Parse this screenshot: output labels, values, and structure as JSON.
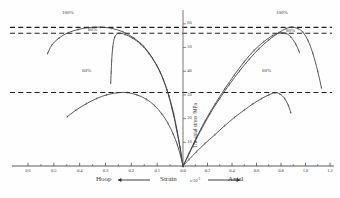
{
  "chart_data": {
    "type": "line",
    "title": "",
    "xlabel": "Strain",
    "xlabel_symbol": "ε/10",
    "xlabel_exponent": "-3",
    "ylabel": "The axial stress /MPa",
    "left_axis_caption": "Hoop",
    "right_axis_caption": "Axial",
    "x_ticks_left": [
      "0.6",
      "0.5",
      "0.4",
      "0.3",
      "0.2",
      "0.1",
      "0.0"
    ],
    "x_ticks_right": [
      "0.0",
      "0.2",
      "0.4",
      "0.6",
      "0.8",
      "1.0",
      "1.2"
    ],
    "y_ticks": [
      "60",
      "50",
      "40",
      "30",
      "20",
      "10"
    ],
    "xlim_left": [
      0.6,
      0.0
    ],
    "xlim_right": [
      0.0,
      1.2
    ],
    "ylim": [
      0,
      65
    ],
    "grid": false,
    "legend_position": "inline-annotations",
    "annotations": [
      {
        "text": "100%",
        "side": "hoop"
      },
      {
        "text": "80%",
        "side": "hoop"
      },
      {
        "text": "60%",
        "side": "hoop"
      },
      {
        "text": "100%",
        "side": "axial"
      },
      {
        "text": "80%",
        "side": "axial"
      },
      {
        "text": "60%",
        "side": "axial"
      }
    ],
    "peak_dashed_lines": [
      58.5,
      56.0,
      31.0
    ],
    "series": [
      {
        "name": "100% hoop",
        "branch": "hoop",
        "peak_stress": 58.5,
        "points": [
          [
            0.0,
            0.0
          ],
          [
            0.012,
            8.0
          ],
          [
            0.026,
            16.0
          ],
          [
            0.042,
            24.0
          ],
          [
            0.062,
            32.0
          ],
          [
            0.088,
            39.5
          ],
          [
            0.118,
            45.5
          ],
          [
            0.152,
            50.5
          ],
          [
            0.19,
            54.0
          ],
          [
            0.232,
            56.6
          ],
          [
            0.276,
            58.1
          ],
          [
            0.32,
            58.6
          ],
          [
            0.366,
            58.4
          ],
          [
            0.406,
            57.6
          ],
          [
            0.446,
            56.2
          ],
          [
            0.48,
            54.0
          ],
          [
            0.508,
            51.0
          ],
          [
            0.524,
            47.5
          ]
        ]
      },
      {
        "name": "80% hoop",
        "branch": "hoop",
        "peak_stress": 56.0,
        "points": [
          [
            0.0,
            0.0
          ],
          [
            0.01,
            7.0
          ],
          [
            0.022,
            14.5
          ],
          [
            0.036,
            22.0
          ],
          [
            0.054,
            29.5
          ],
          [
            0.076,
            36.5
          ],
          [
            0.102,
            42.5
          ],
          [
            0.132,
            47.5
          ],
          [
            0.164,
            51.4
          ],
          [
            0.196,
            54.0
          ],
          [
            0.224,
            55.5
          ],
          [
            0.248,
            56.0
          ],
          [
            0.264,
            54.5
          ],
          [
            0.272,
            50.0
          ],
          [
            0.276,
            44.5
          ],
          [
            0.278,
            39.5
          ],
          [
            0.28,
            35.0
          ]
        ]
      },
      {
        "name": "60% hoop",
        "branch": "hoop",
        "peak_stress": 31.0,
        "points": [
          [
            0.0,
            0.0
          ],
          [
            0.01,
            4.5
          ],
          [
            0.022,
            9.0
          ],
          [
            0.038,
            13.5
          ],
          [
            0.058,
            18.0
          ],
          [
            0.082,
            22.0
          ],
          [
            0.11,
            25.5
          ],
          [
            0.142,
            28.2
          ],
          [
            0.178,
            30.0
          ],
          [
            0.216,
            31.0
          ],
          [
            0.256,
            30.9
          ],
          [
            0.296,
            30.0
          ],
          [
            0.334,
            28.5
          ],
          [
            0.374,
            26.3
          ],
          [
            0.414,
            23.6
          ],
          [
            0.448,
            20.8
          ]
        ]
      },
      {
        "name": "100% axial",
        "branch": "axial",
        "peak_stress": 58.5,
        "points": [
          [
            0.0,
            0.0
          ],
          [
            0.04,
            4.0
          ],
          [
            0.09,
            9.5
          ],
          [
            0.15,
            15.5
          ],
          [
            0.22,
            22.0
          ],
          [
            0.3,
            28.5
          ],
          [
            0.38,
            34.5
          ],
          [
            0.46,
            40.0
          ],
          [
            0.54,
            45.0
          ],
          [
            0.62,
            49.5
          ],
          [
            0.7,
            53.2
          ],
          [
            0.78,
            56.2
          ],
          [
            0.84,
            58.0
          ],
          [
            0.89,
            58.6
          ],
          [
            0.94,
            58.0
          ],
          [
            0.98,
            56.4
          ],
          [
            1.02,
            53.0
          ],
          [
            1.06,
            47.5
          ],
          [
            1.1,
            40.0
          ],
          [
            1.13,
            33.0
          ]
        ]
      },
      {
        "name": "80% axial",
        "branch": "axial",
        "peak_stress": 56.0,
        "points": [
          [
            0.0,
            0.0
          ],
          [
            0.05,
            5.5
          ],
          [
            0.11,
            12.0
          ],
          [
            0.18,
            19.0
          ],
          [
            0.26,
            26.0
          ],
          [
            0.34,
            32.5
          ],
          [
            0.42,
            38.5
          ],
          [
            0.5,
            44.0
          ],
          [
            0.58,
            48.8
          ],
          [
            0.66,
            52.5
          ],
          [
            0.73,
            55.0
          ],
          [
            0.79,
            56.2
          ],
          [
            0.84,
            56.0
          ],
          [
            0.88,
            54.5
          ],
          [
            0.92,
            51.5
          ],
          [
            0.95,
            48.0
          ]
        ]
      },
      {
        "name": "60% axial",
        "branch": "axial",
        "peak_stress": 31.0,
        "points": [
          [
            0.0,
            0.0
          ],
          [
            0.05,
            2.8
          ],
          [
            0.11,
            6.0
          ],
          [
            0.18,
            9.5
          ],
          [
            0.26,
            13.2
          ],
          [
            0.34,
            17.0
          ],
          [
            0.42,
            20.5
          ],
          [
            0.5,
            23.6
          ],
          [
            0.57,
            26.2
          ],
          [
            0.64,
            28.4
          ],
          [
            0.7,
            30.0
          ],
          [
            0.75,
            30.9
          ],
          [
            0.79,
            30.4
          ],
          [
            0.83,
            28.5
          ],
          [
            0.86,
            25.5
          ],
          [
            0.88,
            22.5
          ]
        ]
      }
    ]
  }
}
